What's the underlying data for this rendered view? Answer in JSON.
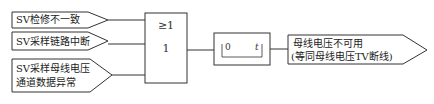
{
  "diagram": {
    "type": "logic_block_diagram",
    "inputs": [
      {
        "id": "in1",
        "label": "SV检修不一致"
      },
      {
        "id": "in2",
        "label": "SV采样链路中断"
      },
      {
        "id": "in3",
        "label_line1": "SV采样母线电压",
        "label_line2": "通道数据异常"
      }
    ],
    "or_gate": {
      "symbol": "≥1",
      "inner_label": "1"
    },
    "timer": {
      "start": "0",
      "end": "t"
    },
    "output": {
      "label_line1": "母线电压不可用",
      "label_line2": "(等同母线电压TV断线)"
    },
    "colors": {
      "stroke": "#333333",
      "background": "#ffffff"
    }
  }
}
